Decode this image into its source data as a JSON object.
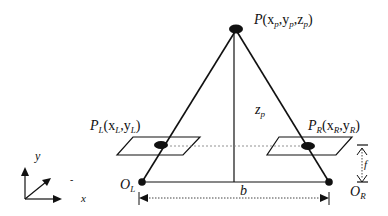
{
  "diagram": {
    "colors": {
      "line": "#111111",
      "dotted": "#555555",
      "background": "#ffffff"
    },
    "labels": {
      "point_P": {
        "main": "P",
        "args": "(x",
        "s1": "p",
        "c1": ",y",
        "s2": "p",
        "c2": ",z",
        "s3": "p",
        "close": ")"
      },
      "point_PL": {
        "main": "P",
        "sub": "L",
        "args": "(x",
        "s1": "L",
        "c1": ",y",
        "s2": "L",
        "close": ")"
      },
      "point_PR": {
        "main": "P",
        "sub": "R",
        "args": "(x",
        "s1": "R",
        "c1": ",y",
        "s2": "R",
        "close": ")"
      },
      "depth": {
        "main": "z",
        "sub": "p"
      },
      "baseline": "b",
      "focal": "f",
      "origin_L": {
        "main": "O",
        "sub": "L"
      },
      "origin_R": {
        "main": "O",
        "sub": "R"
      },
      "axis_y": "y",
      "axis_x": "x",
      "axis_z_mark": "-"
    }
  }
}
